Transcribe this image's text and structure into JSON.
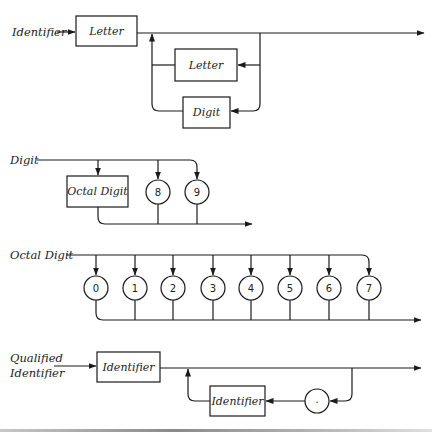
{
  "diagrams": {
    "identifier": {
      "title": "Identifier",
      "first": "Letter",
      "loop_options": [
        "Letter",
        "Digit"
      ]
    },
    "digit": {
      "title": "Digit",
      "options": [
        "Octal Digit",
        "8",
        "9"
      ]
    },
    "octal_digit": {
      "title": "Octal Digit",
      "options": [
        "0",
        "1",
        "2",
        "3",
        "4",
        "5",
        "6",
        "7"
      ]
    },
    "qualified_identifier": {
      "title_line1": "Qualified",
      "title_line2": "Identifier",
      "first": "Identifier",
      "loop_item": "Identifier",
      "separator": "."
    }
  },
  "colors": {
    "line": "#1a1a1a",
    "background": "#ffffff"
  }
}
